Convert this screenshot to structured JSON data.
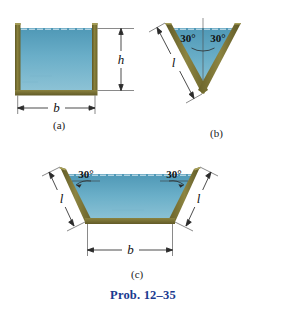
{
  "figure": {
    "caption": "Prob. 12–35",
    "caption_color": "#1a3a8f"
  },
  "palette": {
    "wall": "#7d7535",
    "wall_dark": "#5e5826",
    "wall_light": "#9c9450",
    "water_top": "#58a0bd",
    "water_bottom": "#86bdd2",
    "dimension_line": "#2b2b2b",
    "surface_stipple": "#b9d8e4",
    "background": "#ffffff"
  },
  "subfigures": [
    {
      "id": "a",
      "label": "(a)",
      "shape": "rectangular-channel",
      "dimensions": [
        {
          "name": "height",
          "symbol": "h",
          "orientation": "vertical"
        },
        {
          "name": "width",
          "symbol": "b",
          "orientation": "horizontal"
        }
      ]
    },
    {
      "id": "b",
      "label": "(b)",
      "shape": "v-channel",
      "angles": [
        {
          "value": "30°",
          "side": "left"
        },
        {
          "value": "30°",
          "side": "right"
        }
      ],
      "dimensions": [
        {
          "name": "side-length",
          "symbol": "l",
          "orientation": "slanted"
        }
      ]
    },
    {
      "id": "c",
      "label": "(c)",
      "shape": "trapezoidal-channel",
      "angles": [
        {
          "value": "30°",
          "side": "left"
        },
        {
          "value": "30°",
          "side": "right"
        }
      ],
      "dimensions": [
        {
          "name": "side-length-left",
          "symbol": "l",
          "orientation": "slanted"
        },
        {
          "name": "side-length-right",
          "symbol": "l",
          "orientation": "slanted"
        },
        {
          "name": "bottom-width",
          "symbol": "b",
          "orientation": "horizontal"
        }
      ]
    }
  ]
}
